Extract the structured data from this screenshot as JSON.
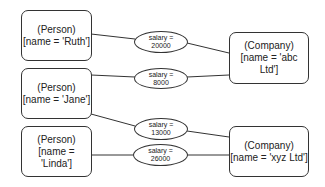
{
  "persons": [
    {
      "type": "(Person)",
      "label": "[name = 'Ruth']"
    },
    {
      "type": "(Person)",
      "label": "[name = 'Jane']"
    },
    {
      "type": "(Person)",
      "label": "[name = 'Linda']"
    }
  ],
  "companies": [
    {
      "type": "(Company)",
      "label": "[name = 'abc Ltd']"
    },
    {
      "type": "(Company)",
      "label": "[name = 'xyz Ltd']"
    }
  ],
  "relations": [
    {
      "key": "salary =",
      "value": "20000",
      "from": "Ruth",
      "to": "abc Ltd"
    },
    {
      "key": "salary =",
      "value": "8000",
      "from": "Jane",
      "to": "abc Ltd"
    },
    {
      "key": "salary =",
      "value": "13000",
      "from": "Jane",
      "to": "xyz Ltd"
    },
    {
      "key": "salary =",
      "value": "26000",
      "from": "Linda",
      "to": "xyz Ltd"
    }
  ]
}
